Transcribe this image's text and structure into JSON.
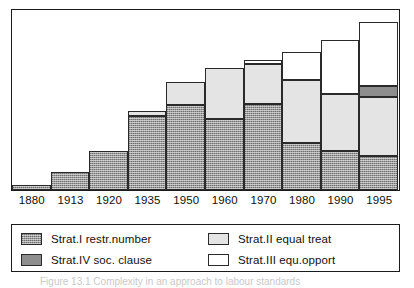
{
  "figure": {
    "caption": "Figure 13.1  Complexity in an approach to labour standards"
  },
  "chart_data": {
    "type": "bar",
    "stacked": true,
    "title": "",
    "xlabel": "",
    "ylabel": "",
    "grid": false,
    "legend_position": "bottom",
    "ylim": [
      0,
      100
    ],
    "categories": [
      "1880",
      "1913",
      "1920",
      "1935",
      "1950",
      "1960",
      "1970",
      "1980",
      "1990",
      "1995"
    ],
    "series": [
      {
        "name": "Strat.I restr.number",
        "key": "strat1",
        "color": "#9a9a9a",
        "pattern": "hatched",
        "values": [
          2.7,
          9.9,
          22.0,
          41.2,
          47.3,
          39.6,
          47.8,
          26.4,
          22.0,
          19.2
        ]
      },
      {
        "name": "Strat.II equal treat",
        "key": "strat2",
        "color": "#e4e4e4",
        "pattern": "solid",
        "values": [
          0,
          0,
          0,
          2.7,
          13.2,
          28.6,
          22.5,
          35.2,
          31.9,
          33.0
        ]
      },
      {
        "name": "Strat.IV soc. clause",
        "key": "strat4",
        "color": "#8e8e8e",
        "pattern": "solid",
        "values": [
          0,
          0,
          0,
          0,
          0,
          0,
          0,
          0,
          0,
          6.0
        ]
      },
      {
        "name": "Strat.III equ.opport",
        "key": "strat3",
        "color": "#ffffff",
        "pattern": "solid",
        "values": [
          0,
          0,
          0,
          0,
          0,
          0,
          2.2,
          15.4,
          29.7,
          35.7
        ]
      }
    ],
    "totals": [
      2.7,
      9.9,
      22.0,
      43.9,
      60.5,
      68.2,
      72.5,
      77.0,
      83.6,
      93.9
    ]
  },
  "legend": {
    "items": [
      {
        "label": "Strat.I restr.number",
        "key": "strat1"
      },
      {
        "label": "Strat.II equal treat",
        "key": "strat2"
      },
      {
        "label": "Strat.IV soc. clause",
        "key": "strat4"
      },
      {
        "label": "Strat.III equ.opport",
        "key": "strat3"
      }
    ]
  }
}
